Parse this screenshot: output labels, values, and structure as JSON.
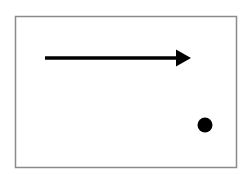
{
  "diagram": {
    "frame": {
      "x": 15.5,
      "y": 16.5,
      "width": 221,
      "height": 151,
      "stroke": "#8a8a8a"
    },
    "arrow": {
      "x1": 45,
      "y1": 58,
      "x2": 176,
      "y2": 58,
      "head_tip_x": 191,
      "head_half_height": 8.5,
      "color": "#000000",
      "direction": "right"
    },
    "dot": {
      "cx": 205,
      "cy": 125,
      "r": 7.5,
      "color": "#000000"
    }
  }
}
